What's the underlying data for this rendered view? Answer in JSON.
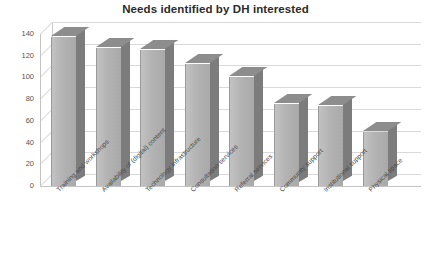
{
  "chart_data": {
    "type": "bar",
    "title": "Needs identified by DH interested",
    "xlabel": "",
    "ylabel": "",
    "ylim": [
      0,
      140
    ],
    "yticks": [
      0,
      20,
      40,
      60,
      80,
      100,
      120,
      140
    ],
    "grid": true,
    "legend": false,
    "style": "3d-column",
    "categories": [
      "Training and workshops",
      "Availability of (digital) content",
      "Technology infrastructure",
      "Consultation services",
      "Referral services",
      "Community support",
      "Institutional support",
      "Physical space"
    ],
    "values": [
      137,
      127,
      125,
      112,
      100,
      76,
      74,
      50
    ],
    "series": [
      {
        "name": "Needs identified",
        "values": [
          137,
          127,
          125,
          112,
          100,
          76,
          74,
          50
        ]
      }
    ]
  },
  "colors": {
    "bar_front": "#b3b3b3",
    "bar_side": "#7c7c7c",
    "bar_top": "#8d8d8d",
    "gridline": "#d9d9d9",
    "axis": "#c4c4c4",
    "title_text": "#2b2b2b",
    "tick_text": "#555555",
    "background": "#ffffff"
  }
}
